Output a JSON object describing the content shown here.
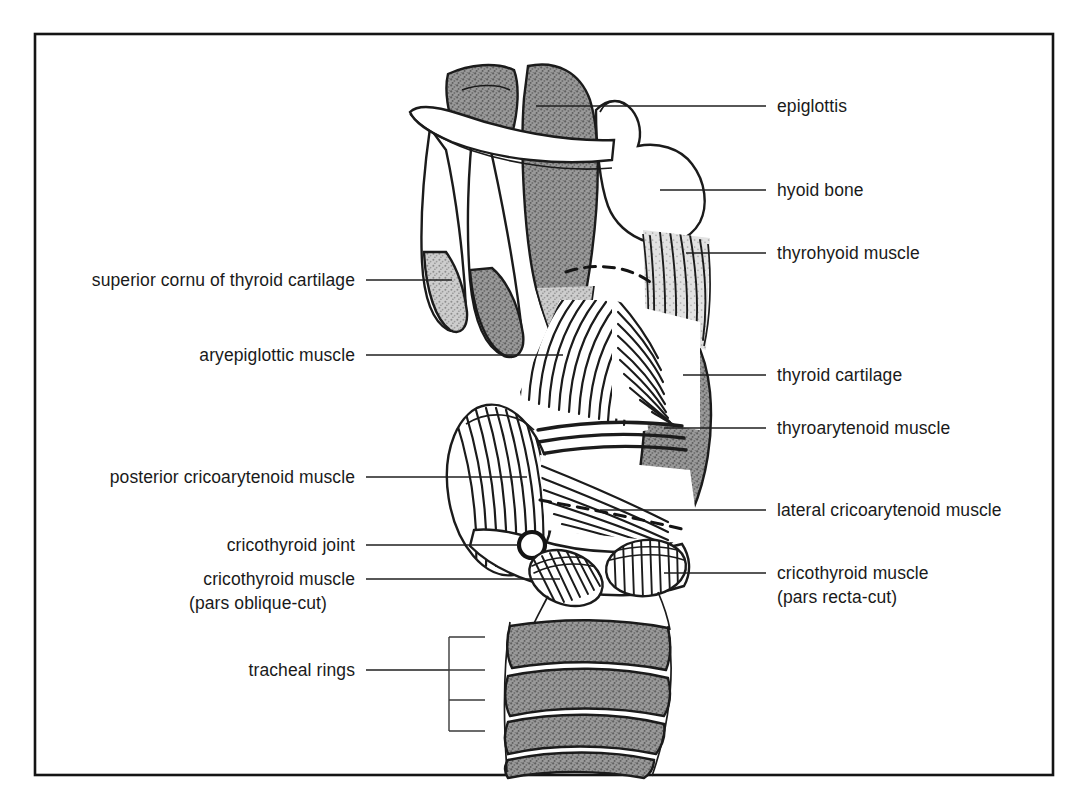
{
  "figure": {
    "frame_color": "#141414",
    "background": "#ffffff",
    "cartilage_fill": "#8a8a8a",
    "cartilage_light_fill": "#b9b9b9",
    "bone_fill": "#ffffff",
    "ink_color": "#1b1b1b"
  },
  "labels_left": [
    {
      "id": "superior-cornu",
      "text": "superior cornu of thyroid cartilage",
      "text_x": 355,
      "text_y": 286,
      "line_x1": 366,
      "line_y1": 280,
      "line_x2": 452,
      "line_y2": 280
    },
    {
      "id": "aryepiglottic-muscle",
      "text": "aryepiglottic muscle",
      "text_x": 355,
      "text_y": 361,
      "line_x1": 366,
      "line_y1": 355,
      "line_x2": 563,
      "line_y2": 355
    },
    {
      "id": "posterior-cricoarytenoid",
      "text": "posterior cricoarytenoid muscle",
      "text_x": 355,
      "text_y": 483,
      "line_x1": 366,
      "line_y1": 477,
      "line_x2": 527,
      "line_y2": 477
    },
    {
      "id": "cricothyroid-joint",
      "text": "cricothyroid joint",
      "text_x": 355,
      "text_y": 551,
      "line_x1": 366,
      "line_y1": 545,
      "line_x2": 519,
      "line_y2": 545
    }
  ],
  "labels_left_multiline": [
    {
      "id": "cricothyroid-pars-oblique",
      "lines": [
        "cricothyroid muscle",
        "(pars oblique-cut)"
      ],
      "center_x": 258,
      "first_y": 585,
      "line_height": 24,
      "line_x1": 366,
      "line_y1": 579,
      "line_x2": 560,
      "line_y2": 579
    }
  ],
  "labels_left_bracket": [
    {
      "id": "tracheal-rings",
      "text": "tracheal rings",
      "text_x": 355,
      "text_y": 676,
      "line_x1": 366,
      "line_y1": 670,
      "line_x2": 449,
      "line_y2": 670,
      "bracket_x": 449,
      "bracket_top": 637,
      "bracket_bottom": 731,
      "ticks": [
        637,
        670,
        700,
        731
      ],
      "tick_len": 36
    }
  ],
  "labels_right": [
    {
      "id": "epiglottis",
      "text": "epiglottis",
      "text_x": 777,
      "text_y": 112,
      "line_x1": 536,
      "line_y1": 106,
      "line_x2": 766,
      "line_y2": 106
    },
    {
      "id": "hyoid-bone",
      "text": "hyoid bone",
      "text_x": 777,
      "text_y": 196,
      "line_x1": 660,
      "line_y1": 190,
      "line_x2": 766,
      "line_y2": 190
    },
    {
      "id": "thyrohyoid-muscle",
      "text": "thyrohyoid muscle",
      "text_x": 777,
      "text_y": 259,
      "line_x1": 686,
      "line_y1": 253,
      "line_x2": 766,
      "line_y2": 253
    },
    {
      "id": "thyroid-cartilage",
      "text": "thyroid cartilage",
      "text_x": 777,
      "text_y": 381,
      "line_x1": 683,
      "line_y1": 375,
      "line_x2": 766,
      "line_y2": 375
    },
    {
      "id": "thyroarytenoid-muscle",
      "text": "thyroarytenoid muscle",
      "text_x": 777,
      "text_y": 434,
      "line_x1": 664,
      "line_y1": 428,
      "line_x2": 766,
      "line_y2": 428
    },
    {
      "id": "lateral-cricoarytenoid",
      "text": "lateral cricoarytenoid muscle",
      "text_x": 777,
      "text_y": 516,
      "line_x1": 600,
      "line_y1": 510,
      "line_x2": 766,
      "line_y2": 510
    }
  ],
  "labels_right_multiline": [
    {
      "id": "cricothyroid-pars-recta",
      "lines": [
        "cricothyroid muscle",
        "(pars recta-cut)"
      ],
      "text_x": 777,
      "first_y": 579,
      "line_height": 24,
      "line_x1": 664,
      "line_y1": 573,
      "line_x2": 766,
      "line_y2": 573
    }
  ],
  "frame": {
    "x": 35,
    "y": 34,
    "width": 1018,
    "height": 741
  }
}
